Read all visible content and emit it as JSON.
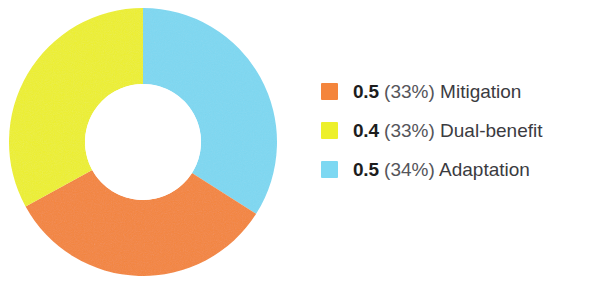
{
  "chart_data": {
    "type": "pie",
    "variant": "donut",
    "title": "",
    "xlabel": "",
    "ylabel": "",
    "legend_position": "right",
    "grid": false,
    "start_angle_deg": 0,
    "direction": "clockwise",
    "categories": [
      "Mitigation",
      "Dual-benefit",
      "Adaptation"
    ],
    "values": [
      0.5,
      0.4,
      0.5
    ],
    "percentages": [
      33,
      33,
      34
    ],
    "colors": [
      "#F4853C",
      "#EDF02A",
      "#7DD8F2"
    ],
    "slices": [
      {
        "label": "Mitigation",
        "value": "0.5",
        "percent": "(33%)",
        "percent_number": 33,
        "color": "#F4853C",
        "swatch_name": "legend-swatch-mitigation"
      },
      {
        "label": "Dual-benefit",
        "value": "0.4",
        "percent": "(33%)",
        "percent_number": 33,
        "color": "#EDF02A",
        "swatch_name": "legend-swatch-dual-benefit"
      },
      {
        "label": "Adaptation",
        "value": "0.5",
        "percent": "(34%)",
        "percent_number": 34,
        "color": "#7DD8F2",
        "swatch_name": "legend-swatch-adaptation"
      }
    ]
  },
  "donut": {
    "center_x": 134,
    "center_y": 134,
    "outer_radius": 134,
    "inner_radius": 58,
    "hole_color": "#FFFFFF",
    "segments": [
      {
        "name": "adaptation",
        "color": "#7DD8F2",
        "start_deg": 0,
        "end_deg": 122.4
      },
      {
        "name": "mitigation",
        "color": "#F4853C",
        "start_deg": 122.4,
        "end_deg": 241.2
      },
      {
        "name": "dual-benefit",
        "color": "#EDF02A",
        "start_deg": 241.2,
        "end_deg": 360
      }
    ]
  }
}
